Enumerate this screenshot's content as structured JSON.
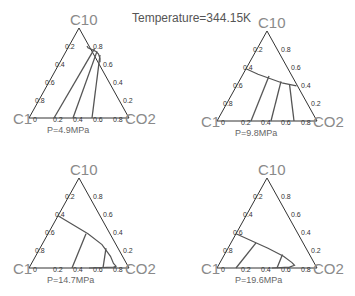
{
  "title": "Temperature=344.15K",
  "chart_data": {
    "type": "ternary",
    "title": "Temperature=344.15K",
    "vertices": {
      "top": "C10",
      "left": "C1",
      "right": "CO2"
    },
    "ticks": [
      "0.2",
      "0.4",
      "0.6",
      "0.8"
    ],
    "base_ticks": [
      "0",
      "0.2",
      "0.4",
      "0.6",
      "0.8"
    ],
    "right_ticks": [
      "0.8",
      "0.6",
      "0.4",
      "0.2",
      "0"
    ],
    "panels": [
      {
        "label": "P=4.9MPa",
        "origin": {
          "x": 29,
          "y": 118
        },
        "binodal": [
          [
            0.18,
            0.8
          ],
          [
            0.2,
            0.78
          ],
          [
            0.25,
            0.76
          ],
          [
            0.3,
            0.74
          ],
          [
            0.34,
            0.71
          ],
          [
            0.38,
            0.66
          ],
          [
            0.4,
            0.62
          ]
        ],
        "tie_lines": [
          [
            [
              0.27,
              0.77
            ],
            [
              0.25,
              0.0
            ]
          ],
          [
            [
              0.31,
              0.74
            ],
            [
              0.44,
              0.0
            ]
          ],
          [
            [
              0.36,
              0.7
            ],
            [
              0.63,
              0.0
            ]
          ]
        ]
      },
      {
        "label": "P=9.8MPa",
        "origin": {
          "x": 217,
          "y": 121
        },
        "binodal": [
          [
            0.0,
            0.58
          ],
          [
            0.15,
            0.52
          ],
          [
            0.3,
            0.47
          ],
          [
            0.45,
            0.42
          ],
          [
            0.6,
            0.39
          ]
        ],
        "tie_lines": [
          [
            [
              0.27,
              0.5
            ],
            [
              0.34,
              0.0
            ]
          ],
          [
            [
              0.42,
              0.44
            ],
            [
              0.54,
              0.0
            ]
          ],
          [
            [
              0.52,
              0.41
            ],
            [
              0.77,
              0.0
            ]
          ]
        ]
      },
      {
        "label": "P=14.7MPa",
        "origin": {
          "x": 29,
          "y": 268
        },
        "binodal": [
          [
            0.0,
            0.58
          ],
          [
            0.2,
            0.48
          ],
          [
            0.4,
            0.38
          ],
          [
            0.6,
            0.26
          ],
          [
            0.75,
            0.13
          ],
          [
            0.82,
            0.05
          ],
          [
            0.86,
            0.02
          ],
          [
            0.84,
            0.01
          ],
          [
            0.6,
            0.0
          ]
        ],
        "tie_lines": [
          [
            [
              0.38,
              0.38
            ],
            [
              0.43,
              0.0
            ]
          ],
          [
            [
              0.66,
              0.22
            ],
            [
              0.74,
              0.0
            ]
          ]
        ]
      },
      {
        "label": "P=19.6MPa",
        "origin": {
          "x": 217,
          "y": 268
        },
        "binodal": [
          [
            0.0,
            0.38
          ],
          [
            0.2,
            0.3
          ],
          [
            0.4,
            0.22
          ],
          [
            0.6,
            0.13
          ],
          [
            0.72,
            0.06
          ],
          [
            0.76,
            0.03
          ],
          [
            0.72,
            0.01
          ],
          [
            0.55,
            0.0
          ]
        ],
        "tie_lines": [
          [
            [
              0.25,
              0.28
            ],
            [
              0.19,
              0.0
            ]
          ],
          [
            [
              0.58,
              0.15
            ],
            [
              0.6,
              0.0
            ]
          ]
        ]
      }
    ]
  },
  "colors": {
    "frame": "#333333",
    "curve": "#555555",
    "vertex_label": "#8a8a8a",
    "title": "#555555"
  }
}
